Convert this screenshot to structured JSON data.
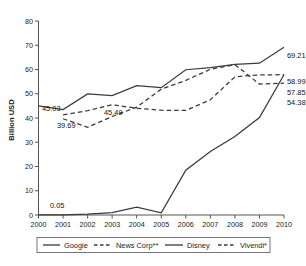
{
  "chart_data": {
    "type": "line",
    "title": "",
    "xlabel": "",
    "ylabel": "Billion USD",
    "grid": false,
    "legend_position": "bottom",
    "x": [
      2000,
      2001,
      2002,
      2003,
      2004,
      2005,
      2006,
      2007,
      2008,
      2009,
      2010
    ],
    "xtick_labels": [
      "2000",
      "2001",
      "2002",
      "2003",
      "2004",
      "2005",
      "2006",
      "2007",
      "2008",
      "2009",
      "2010"
    ],
    "ytick_labels": [
      "0",
      "10",
      "20",
      "30",
      "40",
      "50",
      "60",
      "70",
      "80"
    ],
    "ytick_values": [
      0,
      10,
      20,
      30,
      40,
      50,
      60,
      70,
      80
    ],
    "ylim": [
      0,
      80
    ],
    "xlim": [
      2000,
      2010
    ],
    "series": [
      {
        "name": "Google",
        "style": "solid",
        "values": [
          0.05,
          0.09,
          0.35,
          0.96,
          3.19,
          0.9,
          18.5,
          26.2,
          32.4,
          40.2,
          57.85
        ]
      },
      {
        "name": "News Corp**",
        "style": "dashed",
        "values": [
          null,
          39.69,
          36.2,
          40.6,
          44.5,
          51.9,
          55.5,
          60.1,
          62.0,
          54.0,
          54.38
        ]
      },
      {
        "name": "Disney",
        "style": "solid",
        "values": [
          45.03,
          43.5,
          49.9,
          49.2,
          53.3,
          52.5,
          59.9,
          60.8,
          62.1,
          62.6,
          69.21
        ]
      },
      {
        "name": "Vivendi*",
        "style": "dashed",
        "values": [
          null,
          41.3,
          43.0,
          45.49,
          44.0,
          43.2,
          43.1,
          47.5,
          57.0,
          57.8,
          57.85
        ]
      }
    ],
    "point_labels": [
      {
        "text": "45.03",
        "series": "Disney",
        "x": 2000
      },
      {
        "text": "39.69",
        "series": "News Corp**",
        "x": 2001
      },
      {
        "text": "45.49",
        "series": "Vivendi*",
        "x": 2003
      },
      {
        "text": "0.05",
        "series": "Google",
        "x": 2000
      },
      {
        "text": "69.21",
        "series": "Disney",
        "x": 2010
      },
      {
        "text": "58.99",
        "series": "News Corp**",
        "x": 2010
      },
      {
        "text": "57.85",
        "series": "Vivendi*",
        "x": 2010
      },
      {
        "text": "54.38",
        "series": "Google",
        "x": 2010
      }
    ],
    "legend": [
      "Google",
      "News Corp**",
      "Disney",
      "Vivendi*"
    ]
  },
  "axis": {
    "ylabel": "Billion USD",
    "yticks": [
      "80",
      "70",
      "60",
      "50",
      "40",
      "30",
      "20",
      "10",
      "0"
    ],
    "xticks": [
      "2000",
      "2001",
      "2002",
      "2003",
      "2004",
      "2005",
      "2006",
      "2007",
      "2008",
      "2009",
      "2010"
    ]
  },
  "labels": {
    "left_disney": "45.03",
    "left_newscorp": "39.69",
    "mid_vivendi": "45.49",
    "left_google": "0.05",
    "right_1": "69.21",
    "right_2": "58.99",
    "right_3": "57.85",
    "right_4": "54.38"
  },
  "legend": {
    "items": [
      {
        "label": "Google",
        "style": "solid"
      },
      {
        "label": "News Corp**",
        "style": "dashed"
      },
      {
        "label": "Disney",
        "style": "solid"
      },
      {
        "label": "Vivendi*",
        "style": "dashed"
      }
    ]
  },
  "caption": {
    "text": ""
  },
  "colors": {
    "line": "#3a3a3a",
    "axis": "#555555",
    "text": "#1a1a1a"
  }
}
